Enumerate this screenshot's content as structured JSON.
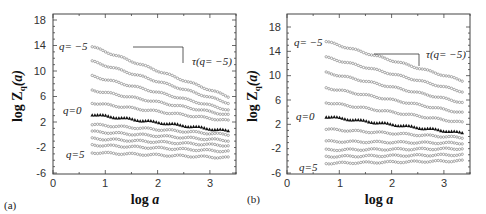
{
  "chart_data": [
    {
      "type": "scatter",
      "panel_label": "(a)",
      "title": "",
      "xlabel": "log a",
      "ylabel": "log Z_q(a)",
      "xlim": [
        0,
        3.5
      ],
      "ylim": [
        -6,
        19
      ],
      "xticks": [
        0,
        1,
        2,
        3
      ],
      "yticks": [
        -6,
        -2,
        2,
        6,
        10,
        14,
        18
      ],
      "grid": false,
      "annotations": [
        "q= -5",
        "q=0",
        "q=5",
        "τ(q= -5)"
      ],
      "x_range": [
        0.75,
        3.35
      ],
      "series": [
        {
          "name": "q=-5",
          "start": 13.8,
          "end": 6.0
        },
        {
          "name": "q=-4",
          "start": 11.5,
          "end": 5.0
        },
        {
          "name": "q=-3",
          "start": 9.2,
          "end": 3.9
        },
        {
          "name": "q=-2",
          "start": 7.0,
          "end": 3.1
        },
        {
          "name": "q=-1",
          "start": 5.0,
          "end": 2.2
        },
        {
          "name": "q=0",
          "start": 3.2,
          "end": 0.6,
          "marker": "triangle"
        },
        {
          "name": "q=1",
          "start": 1.6,
          "end": 0.0
        },
        {
          "name": "q=2",
          "start": 0.5,
          "end": -0.9
        },
        {
          "name": "q=3",
          "start": -0.6,
          "end": -1.7
        },
        {
          "name": "q=4",
          "start": -1.6,
          "end": -2.6
        },
        {
          "name": "q=5",
          "start": -2.8,
          "end": -3.6
        }
      ]
    },
    {
      "type": "scatter",
      "panel_label": "(b)",
      "title": "",
      "xlabel": "log a",
      "ylabel": "log Z_q(a)",
      "xlim": [
        0,
        3.5
      ],
      "ylim": [
        -6,
        20
      ],
      "xticks": [
        0,
        1,
        2,
        3
      ],
      "yticks": [
        -6,
        -2,
        2,
        6,
        10,
        14,
        18
      ],
      "grid": false,
      "annotations": [
        "q= -5",
        "q=0",
        "q=5",
        "τ(q= -5)"
      ],
      "x_range": [
        0.75,
        3.35
      ],
      "series": [
        {
          "name": "q=-5",
          "start": 15.6,
          "end": 9.2
        },
        {
          "name": "q=-4",
          "start": 13.0,
          "end": 7.4
        },
        {
          "name": "q=-3",
          "start": 10.5,
          "end": 5.6
        },
        {
          "name": "q=-2",
          "start": 8.0,
          "end": 3.9
        },
        {
          "name": "q=-1",
          "start": 5.6,
          "end": 2.3
        },
        {
          "name": "q=0",
          "start": 3.3,
          "end": 0.6,
          "marker": "triangle"
        },
        {
          "name": "q=1",
          "start": 1.2,
          "end": -0.2
        },
        {
          "name": "q=2",
          "start": -0.8,
          "end": -1.1
        },
        {
          "name": "q=3",
          "start": -2.2,
          "end": -2.0
        },
        {
          "name": "q=4",
          "start": -3.3,
          "end": -3.0
        },
        {
          "name": "q=5",
          "start": -4.4,
          "end": -4.0
        }
      ]
    }
  ],
  "panels": [
    {
      "label": "(a)",
      "xlabel": "log a",
      "ylabel_main": "log Z",
      "ylabel_sub": "q",
      "ylabel_arg": "(a)",
      "annot_top": "q= −5",
      "annot_mid": "q=0",
      "annot_bot": "q=5",
      "annot_tau": "τ(q= −5)",
      "xtick_labels": [
        "0",
        "1",
        "2",
        "3"
      ],
      "ytick_labels": [
        "-6",
        "-2",
        "2",
        "6",
        "10",
        "14",
        "18"
      ]
    },
    {
      "label": "(b)",
      "xlabel": "log a",
      "ylabel_main": "log Z",
      "ylabel_sub": "q",
      "ylabel_arg": "(a)",
      "annot_top": "q= −5",
      "annot_mid": "q=0",
      "annot_bot": "q=5",
      "annot_tau": "τ(q= −5)",
      "xtick_labels": [
        "0",
        "1",
        "2",
        "3"
      ],
      "ytick_labels": [
        "-6",
        "-2",
        "2",
        "6",
        "10",
        "14",
        "18"
      ]
    }
  ],
  "colors": {
    "markers": "#888888",
    "q0_markers": "#111111",
    "axes": "#444444"
  }
}
